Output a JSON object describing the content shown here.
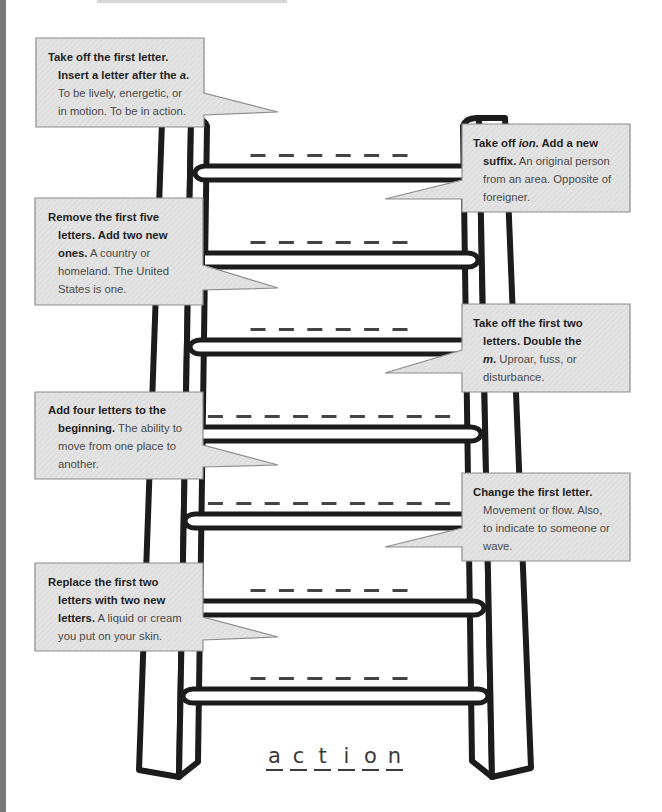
{
  "clues": [
    {
      "lines": [
        [
          {
            "text": "Take off the first letter.",
            "style": "bold"
          }
        ],
        [
          {
            "text": "Insert a letter after the ",
            "style": "bold"
          },
          {
            "text": "a",
            "style": "bold-italic"
          },
          {
            "text": ".",
            "style": "bold"
          }
        ],
        [
          {
            "text": "To be lively, energetic, or",
            "style": "regular"
          }
        ],
        [
          {
            "text": "in motion. To be in action.",
            "style": "regular"
          }
        ]
      ]
    },
    {
      "lines": [
        [
          {
            "text": "Take off ",
            "style": "bold"
          },
          {
            "text": "ion",
            "style": "bold-italic"
          },
          {
            "text": ". Add a new",
            "style": "bold"
          }
        ],
        [
          {
            "text": "suffix.",
            "style": "bold"
          },
          {
            "text": " An original person",
            "style": "regular"
          }
        ],
        [
          {
            "text": "from an area. Opposite of",
            "style": "regular"
          }
        ],
        [
          {
            "text": "foreigner.",
            "style": "regular"
          }
        ]
      ]
    },
    {
      "lines": [
        [
          {
            "text": "Remove the first five",
            "style": "bold"
          }
        ],
        [
          {
            "text": "letters. Add two new",
            "style": "bold"
          }
        ],
        [
          {
            "text": "ones.",
            "style": "bold"
          },
          {
            "text": " A country or",
            "style": "regular"
          }
        ],
        [
          {
            "text": "homeland. The United",
            "style": "regular"
          }
        ],
        [
          {
            "text": "States is one.",
            "style": "regular"
          }
        ]
      ]
    },
    {
      "lines": [
        [
          {
            "text": "Take off the first two",
            "style": "bold"
          }
        ],
        [
          {
            "text": "letters. Double the",
            "style": "bold"
          }
        ],
        [
          {
            "text": "m",
            "style": "bold-italic"
          },
          {
            "text": ".",
            "style": "bold"
          },
          {
            "text": " Uproar, fuss, or",
            "style": "regular"
          }
        ],
        [
          {
            "text": "disturbance.",
            "style": "regular"
          }
        ]
      ]
    },
    {
      "lines": [
        [
          {
            "text": "Add four letters to the",
            "style": "bold"
          }
        ],
        [
          {
            "text": "beginning.",
            "style": "bold"
          },
          {
            "text": " The ability to",
            "style": "regular"
          }
        ],
        [
          {
            "text": "move from one place to",
            "style": "regular"
          }
        ],
        [
          {
            "text": "another.",
            "style": "regular"
          }
        ]
      ]
    },
    {
      "lines": [
        [
          {
            "text": "Change the first letter.",
            "style": "bold"
          }
        ],
        [
          {
            "text": "Movement or flow. Also,",
            "style": "regular"
          }
        ],
        [
          {
            "text": "to indicate to someone or",
            "style": "regular"
          }
        ],
        [
          {
            "text": "wave.",
            "style": "regular"
          }
        ]
      ]
    },
    {
      "lines": [
        [
          {
            "text": "Replace the first two",
            "style": "bold"
          }
        ],
        [
          {
            "text": "letters with two new",
            "style": "bold"
          }
        ],
        [
          {
            "text": "letters.",
            "style": "bold"
          },
          {
            "text": " A liquid or cream",
            "style": "regular"
          }
        ],
        [
          {
            "text": "you put on your skin.",
            "style": "regular"
          }
        ]
      ]
    }
  ],
  "ladder": {
    "rungs": [
      {
        "blanks": 6
      },
      {
        "blanks": 6
      },
      {
        "blanks": 6
      },
      {
        "blanks": 9
      },
      {
        "blanks": 9
      },
      {
        "blanks": 6
      },
      {
        "blanks": 6
      }
    ]
  },
  "start_word": {
    "letters": [
      "a",
      "c",
      "t",
      "i",
      "o",
      "n"
    ]
  },
  "colors": {
    "box_fill": "#e3e3e3",
    "box_border": "#8c8c8c",
    "ladder_stroke": "#1c1c1c",
    "edge_bar": "#7a7a7a"
  }
}
